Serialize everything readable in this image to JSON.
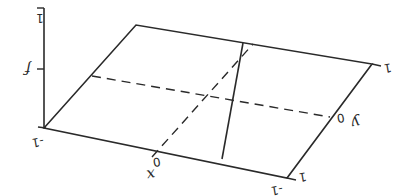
{
  "diagram": {
    "axes": {
      "f_label": "f",
      "x_label": "x",
      "y_label": "y"
    },
    "ticks": {
      "f_top": "1",
      "corner_back": "-1",
      "x_zero": "0",
      "y_zero": "0",
      "x_end": "1",
      "corner_front": "-1",
      "y_end": "1"
    },
    "colors": {
      "ink": "#2a2a2a",
      "background": "#ffffff"
    }
  }
}
